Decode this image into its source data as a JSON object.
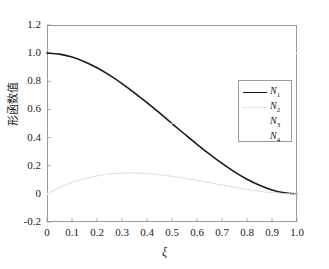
{
  "chart_data": {
    "type": "line",
    "title": "",
    "xlabel": "ξ",
    "ylabel": "形函数值",
    "xlim": [
      0,
      1.0
    ],
    "ylim": [
      -0.2,
      1.2
    ],
    "grid": false,
    "legend_position": "center-right",
    "xticks": [
      "0",
      "0.1",
      "0.2",
      "0.3",
      "0.4",
      "0.5",
      "0.6",
      "0.7",
      "0.8",
      "0.9",
      "1.0"
    ],
    "xtick_values": [
      0,
      0.1,
      0.2,
      0.3,
      0.4,
      0.5,
      0.6,
      0.7,
      0.8,
      0.9,
      1.0
    ],
    "yticks": [
      "-0.2",
      "0",
      "0.2",
      "0.4",
      "0.6",
      "0.8",
      "1.0",
      "1.2"
    ],
    "ytick_values": [
      -0.2,
      0,
      0.2,
      0.4,
      0.6,
      0.8,
      1.0,
      1.2
    ],
    "x": [
      0,
      0.05,
      0.1,
      0.15,
      0.2,
      0.25,
      0.3,
      0.35,
      0.4,
      0.45,
      0.5,
      0.55,
      0.6,
      0.65,
      0.7,
      0.75,
      0.8,
      0.85,
      0.9,
      0.95,
      1.0
    ],
    "series": [
      {
        "name": "N1",
        "label": "N",
        "sub": "1",
        "color": "#1a1a1a",
        "style": "solid",
        "width": 1.6,
        "values": [
          1.0,
          0.9928,
          0.972,
          0.9393,
          0.896,
          0.8438,
          0.784,
          0.7183,
          0.648,
          0.5748,
          0.5,
          0.4253,
          0.352,
          0.2818,
          0.216,
          0.1563,
          0.104,
          0.0608,
          0.028,
          0.0073,
          0.0
        ]
      },
      {
        "name": "N2",
        "label": "N",
        "sub": "2",
        "color": "#d8d8d8",
        "style": "dotted",
        "width": 1.2,
        "values": [
          0.0,
          0.0451,
          0.081,
          0.1084,
          0.128,
          0.1406,
          0.147,
          0.1479,
          0.144,
          0.1361,
          0.125,
          0.1114,
          0.096,
          0.0796,
          0.063,
          0.0469,
          0.032,
          0.0191,
          0.009,
          0.0024,
          0.0
        ]
      },
      {
        "name": "N3",
        "label": "N",
        "sub": "3",
        "color": "#ffffff",
        "style": "solid",
        "width": 1.0,
        "values": [
          0.0,
          0.0072,
          0.028,
          0.0607,
          0.104,
          0.1562,
          0.216,
          0.2817,
          0.352,
          0.4252,
          0.5,
          0.5747,
          0.648,
          0.7182,
          0.784,
          0.8437,
          0.896,
          0.9392,
          0.972,
          0.9927,
          1.0
        ]
      },
      {
        "name": "N4",
        "label": "N",
        "sub": "4",
        "color": "#ffffff",
        "style": "solid",
        "width": 1.0,
        "values": [
          0.0,
          -0.0024,
          -0.009,
          -0.0191,
          -0.032,
          -0.0469,
          -0.063,
          -0.0796,
          -0.096,
          -0.1114,
          -0.125,
          -0.1361,
          -0.144,
          -0.1479,
          -0.147,
          -0.1406,
          -0.128,
          -0.1084,
          -0.081,
          -0.0451,
          0.0
        ]
      }
    ],
    "legend_entries": [
      {
        "label": "N",
        "sub": "1",
        "style": "solid",
        "color": "#1a1a1a"
      },
      {
        "label": "N",
        "sub": "2",
        "style": "dotted",
        "color": "#cfcfcf"
      },
      {
        "label": "N",
        "sub": "3",
        "style": "none",
        "color": "#ffffff"
      },
      {
        "label": "N",
        "sub": "4",
        "style": "none",
        "color": "#ffffff"
      }
    ]
  },
  "axes": {
    "x_label": "ξ",
    "y_label": "形函数值"
  }
}
